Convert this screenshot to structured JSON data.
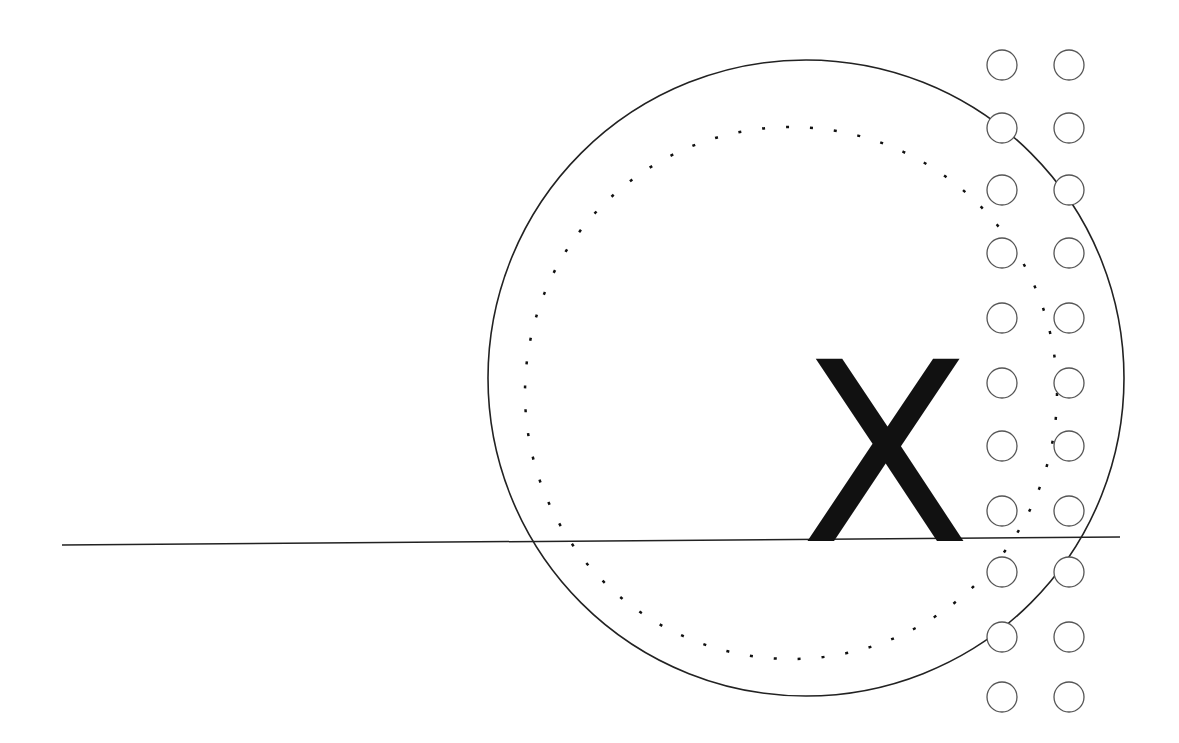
{
  "diagram": {
    "label": "X",
    "colors": {
      "stroke": "#222222",
      "small_circle_stroke": "#555555",
      "background": "#ffffff"
    },
    "outer_circle": {
      "cx": 806,
      "cy": 378,
      "r": 318
    },
    "dotted_circle": {
      "cx": 791,
      "cy": 393,
      "r": 266
    },
    "horizontal_line": {
      "x1": 62,
      "y1": 545,
      "x2": 1120,
      "y2": 537
    },
    "small_circle_columns": [
      1002,
      1069
    ],
    "small_circle_rows": [
      65,
      128,
      190,
      253,
      318,
      383,
      446,
      511,
      572,
      637,
      697
    ],
    "small_circle_radius": 15
  }
}
